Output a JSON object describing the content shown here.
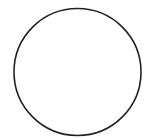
{
  "canvas": {
    "width": 156,
    "height": 138,
    "background": "#ffffff"
  },
  "shapes": [
    {
      "type": "circle",
      "cx": 77.5,
      "cy": 72,
      "r": 63.5,
      "stroke": "#222222",
      "stroke_width": 1.6,
      "fill": "none"
    }
  ]
}
